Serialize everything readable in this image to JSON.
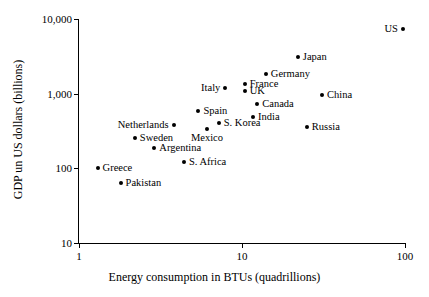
{
  "chart_data": {
    "type": "scatter",
    "title": "",
    "xlabel": "Energy consumption in BTUs (quadrillions)",
    "ylabel": "GDP un US dollars (billions)",
    "xscale": "log",
    "yscale": "log",
    "xlim": [
      1,
      100
    ],
    "ylim": [
      10,
      10000
    ],
    "grid": false,
    "legend": "none",
    "xticks": [
      {
        "value": 1,
        "label": "1"
      },
      {
        "value": 10,
        "label": "10"
      },
      {
        "value": 100,
        "label": "100"
      }
    ],
    "yticks": [
      {
        "value": 10,
        "label": "10"
      },
      {
        "value": 100,
        "label": "100"
      },
      {
        "value": 1000,
        "label": "1,000"
      },
      {
        "value": 10000,
        "label": "10,000"
      }
    ],
    "points": [
      {
        "name": "US",
        "x": 97.0,
        "y": 7300,
        "label_pos": "left"
      },
      {
        "name": "Japan",
        "x": 22.0,
        "y": 3100,
        "label_pos": "right"
      },
      {
        "name": "Germany",
        "x": 14.0,
        "y": 1850,
        "label_pos": "right"
      },
      {
        "name": "France",
        "x": 10.4,
        "y": 1350,
        "label_pos": "right"
      },
      {
        "name": "UK",
        "x": 10.4,
        "y": 1100,
        "label_pos": "right"
      },
      {
        "name": "Italy",
        "x": 7.9,
        "y": 1180,
        "label_pos": "left"
      },
      {
        "name": "China",
        "x": 31.0,
        "y": 960,
        "label_pos": "right"
      },
      {
        "name": "Canada",
        "x": 12.4,
        "y": 730,
        "label_pos": "right"
      },
      {
        "name": "Spain",
        "x": 5.4,
        "y": 590,
        "label_pos": "right"
      },
      {
        "name": "India",
        "x": 11.7,
        "y": 480,
        "label_pos": "right"
      },
      {
        "name": "S. Korea",
        "x": 7.2,
        "y": 410,
        "label_pos": "right"
      },
      {
        "name": "Netherlands",
        "x": 3.8,
        "y": 380,
        "label_pos": "left"
      },
      {
        "name": "Russia",
        "x": 25.0,
        "y": 355,
        "label_pos": "right"
      },
      {
        "name": "Mexico",
        "x": 6.1,
        "y": 340,
        "label_pos": "below"
      },
      {
        "name": "Sweden",
        "x": 2.2,
        "y": 255,
        "label_pos": "right"
      },
      {
        "name": "Argentina",
        "x": 2.9,
        "y": 190,
        "label_pos": "right"
      },
      {
        "name": "S. Africa",
        "x": 4.4,
        "y": 122,
        "label_pos": "right"
      },
      {
        "name": "Greece",
        "x": 1.3,
        "y": 100,
        "label_pos": "right"
      },
      {
        "name": "Pakistan",
        "x": 1.8,
        "y": 63,
        "label_pos": "right"
      }
    ]
  }
}
